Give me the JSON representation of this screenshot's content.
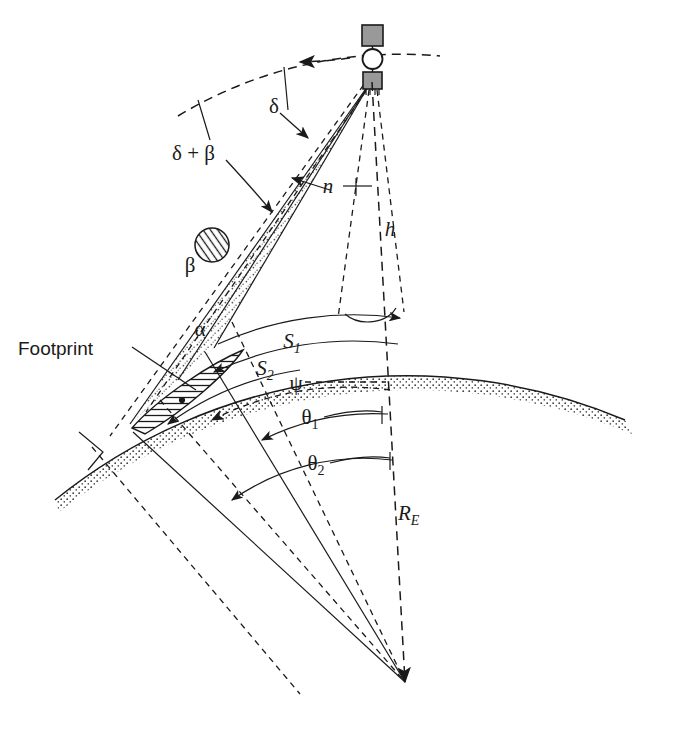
{
  "figure": {
    "kind": "satellite-earth-scanning-geometry-diagram",
    "background_color": "#ffffff",
    "ink_color": "#1a1a1a",
    "panel_fill": "#999999"
  },
  "labels": {
    "delta": "δ",
    "delta_plus_beta": "δ + β",
    "beta": "β",
    "alpha": "α",
    "n": "n",
    "h": "h",
    "psi": "ψ",
    "theta1_base": "θ",
    "theta1_sub": "1",
    "theta2_base": "θ",
    "theta2_sub": "2",
    "s1_base": "S",
    "s1_sub": "1",
    "s2_base": "S",
    "s2_sub": "2",
    "re_base": "R",
    "re_sub": "E",
    "footprint": "Footprint"
  },
  "elements": {
    "satellite": "satellite-icon",
    "orbit_arc": "orbit-path-dashed-with-direction-arrow",
    "earth_surface": "earth-surface-arc-with-stipple-band",
    "beam_cone": "sensor-beam-cone-stippled",
    "footprint_patch": "hatched-footprint-ellipse",
    "beta_circle": "hatched-beta-circle",
    "nadir_patch": "nadir-footprint-arc",
    "right_angle": "right-angle-marker",
    "earth_center": "earth-center-convergence-point"
  }
}
